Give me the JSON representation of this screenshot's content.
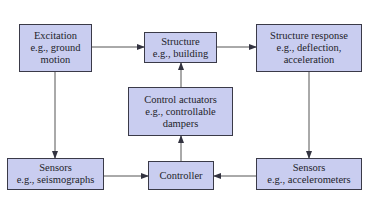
{
  "diagram": {
    "type": "block-diagram",
    "title": "",
    "colors": {
      "box_fill": "#c9cdf0",
      "box_border": "#3a3a48",
      "arrow": "#444444",
      "text": "#1e1e2a"
    },
    "nodes": {
      "excitation": {
        "title": "Excitation",
        "example_line1": "e.g., ground",
        "example_line2": "motion"
      },
      "structure": {
        "title": "Structure",
        "example_line1": "e.g., building"
      },
      "structure_response": {
        "title": "Structure response",
        "example_line1": "e.g., deflection,",
        "example_line2": "acceleration"
      },
      "control_actuators": {
        "title": "Control actuators",
        "example_line1": "e.g., controllable",
        "example_line2": "dampers"
      },
      "sensors_left": {
        "title": "Sensors",
        "example_line1": "e.g., seismographs"
      },
      "controller": {
        "title": "Controller"
      },
      "sensors_right": {
        "title": "Sensors",
        "example_line1": "e.g., accelerometers"
      }
    },
    "edges": [
      {
        "from": "excitation",
        "to": "structure"
      },
      {
        "from": "structure",
        "to": "structure_response"
      },
      {
        "from": "excitation",
        "to": "sensors_left"
      },
      {
        "from": "structure_response",
        "to": "sensors_right"
      },
      {
        "from": "sensors_left",
        "to": "controller"
      },
      {
        "from": "sensors_right",
        "to": "controller"
      },
      {
        "from": "controller",
        "to": "control_actuators"
      },
      {
        "from": "control_actuators",
        "to": "structure"
      }
    ]
  }
}
